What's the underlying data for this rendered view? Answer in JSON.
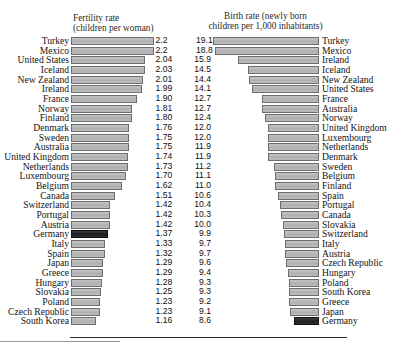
{
  "headers": {
    "fertility": "Fertility rate\n(children per woman)",
    "birth": "Birth rate (newly born\nchildren per 1,000 inhabitants)"
  },
  "colors": {
    "bar": "#b6b6b6",
    "bar_border": "#6d6d6d",
    "highlight": "#2a2a2a",
    "background": "#ffffff",
    "text": "#141414"
  },
  "highlight_country": "Germany",
  "chart_data": {
    "type": "bar",
    "orientation": "horizontal",
    "layout": "back-to-back paired ranking, left series sorted descending, right series sorted descending independently",
    "grid": false,
    "legend": "none",
    "panels": [
      {
        "name": "fertility",
        "title": "Fertility rate",
        "subtitle": "(children per woman)",
        "unit": "children per woman",
        "xlim": [
          0,
          2.2
        ],
        "direction": "bars extend leftward from the value labels",
        "categories": [
          "Turkey",
          "Mexico",
          "United States",
          "Iceland",
          "New Zealand",
          "Ireland",
          "France",
          "Norway",
          "Finland",
          "Denmark",
          "Sweden",
          "Australia",
          "United Kingdom",
          "Netherlands",
          "Luxembourg",
          "Belgium",
          "Canada",
          "Switzerland",
          "Portugal",
          "Austria",
          "Germany",
          "Italy",
          "Spain",
          "Japan",
          "Greece",
          "Hungary",
          "Slovakia",
          "Poland",
          "Czech Republic",
          "South Korea"
        ],
        "values": [
          2.2,
          2.2,
          2.04,
          2.03,
          2.01,
          1.99,
          1.9,
          1.81,
          1.8,
          1.76,
          1.75,
          1.75,
          1.74,
          1.73,
          1.7,
          1.62,
          1.51,
          1.42,
          1.42,
          1.42,
          1.37,
          1.33,
          1.32,
          1.29,
          1.29,
          1.28,
          1.25,
          1.23,
          1.23,
          1.16
        ],
        "labels": [
          "2.2",
          "2.2",
          "2.04",
          "2.03",
          "2.01",
          "1.99",
          "1.90",
          "1.81",
          "1.80",
          "1.76",
          "1.75",
          "1.75",
          "1.74",
          "1.73",
          "1.70",
          "1.62",
          "1.51",
          "1.42",
          "1.42",
          "1.42",
          "1.37",
          "1.33",
          "1.32",
          "1.29",
          "1.29",
          "1.28",
          "1.25",
          "1.23",
          "1.23",
          "1.16"
        ]
      },
      {
        "name": "birth",
        "title": "Birth rate (newly born",
        "subtitle": "children per 1,000 inhabitants)",
        "unit": "per 1,000 inhabitants",
        "xlim": [
          0,
          19.1
        ],
        "direction": "bars extend rightward from the value labels",
        "categories": [
          "Turkey",
          "Mexico",
          "Ireland",
          "Iceland",
          "New Zealand",
          "United States",
          "France",
          "Australia",
          "Norway",
          "United Kingdom",
          "Luxembourg",
          "Netherlands",
          "Denmark",
          "Sweden",
          "Belgium",
          "Finland",
          "Spain",
          "Portugal",
          "Canada",
          "Slovakia",
          "Switzerland",
          "Italy",
          "Austria",
          "Czech Republic",
          "Hungary",
          "Poland",
          "South Korea",
          "Greece",
          "Japan",
          "Germany"
        ],
        "values": [
          19.1,
          18.8,
          15.9,
          14.5,
          14.4,
          14.1,
          12.7,
          12.7,
          12.4,
          12.0,
          12.0,
          11.9,
          11.9,
          11.2,
          11.1,
          11.0,
          10.6,
          10.4,
          10.3,
          10.0,
          9.9,
          9.7,
          9.7,
          9.6,
          9.4,
          9.3,
          9.3,
          9.2,
          9.1,
          8.6
        ],
        "labels": [
          "19.1",
          "18.8",
          "15.9",
          "14.5",
          "14.4",
          "14.1",
          "12.7",
          "12.7",
          "12.4",
          "12.0",
          "12.0",
          "11.9",
          "11.9",
          "11.2",
          "11.1",
          "11.0",
          "10.6",
          "10.4",
          "10.3",
          "10.0",
          "9.9",
          "9.7",
          "9.7",
          "9.6",
          "9.4",
          "9.3",
          "9.3",
          "9.2",
          "9.1",
          "8.6"
        ]
      }
    ]
  }
}
